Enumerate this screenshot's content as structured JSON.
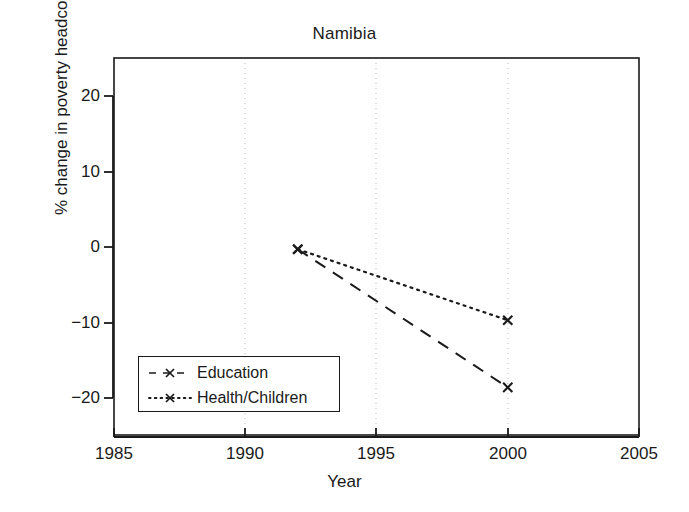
{
  "chart_data": {
    "type": "line",
    "title": "Namibia",
    "xlabel": "Year",
    "ylabel": "% change in poverty headcount",
    "xlim": [
      1985,
      2005
    ],
    "ylim": [
      -25,
      24
    ],
    "xticks": [
      "1985",
      "1990",
      "1995",
      "2000",
      "2005"
    ],
    "xtick_values": [
      1985,
      1990,
      1995,
      2000,
      2005
    ],
    "yticks": [
      "20",
      "10",
      "0",
      "−10",
      "−20"
    ],
    "ytick_values": [
      20,
      10,
      0,
      -10,
      -20
    ],
    "grid": "vertical dotted gridlines at 1990, 1995, 2000",
    "legend_position": "lower left inside axes",
    "series": [
      {
        "name": "Education",
        "linestyle": "dashed",
        "marker": "x",
        "color": "#1a1a1a",
        "x": [
          1992,
          2000
        ],
        "values": [
          -0.3,
          -18.6
        ]
      },
      {
        "name": "Health/Children",
        "linestyle": "dotted",
        "marker": "x",
        "color": "#1a1a1a",
        "x": [
          1992,
          2000
        ],
        "values": [
          -0.3,
          -9.7
        ]
      }
    ]
  },
  "chart": {
    "title": "Namibia",
    "axis_x_label": "Year",
    "axis_y_label": "% change in poverty headcount",
    "xtick_labels": [
      "1985",
      "1990",
      "1995",
      "2000",
      "2005"
    ],
    "ytick_labels": [
      "20",
      "10",
      "0",
      "−10",
      "−20"
    ],
    "legend": {
      "items": [
        {
          "label": "Education",
          "style": "dashed-x"
        },
        {
          "label": "Health/Children",
          "style": "dotted-x"
        }
      ]
    },
    "colors": {
      "foreground": "#1a1a1a",
      "background": "#ffffff",
      "gridline": "#b9b9b9"
    }
  }
}
